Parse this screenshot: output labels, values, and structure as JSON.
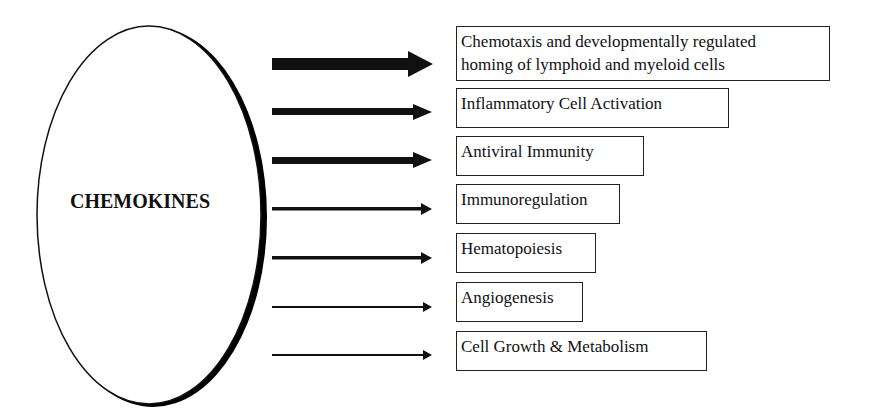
{
  "center": {
    "label": "CHEMOKINES"
  },
  "functions": [
    {
      "label_lines": [
        "Chemotaxis and developmentally regulated",
        "homing of lymphoid and myeloid cells"
      ],
      "arrow_weight": "heavy"
    },
    {
      "label_lines": [
        "Inflammatory Cell Activation"
      ],
      "arrow_weight": "medium-heavy"
    },
    {
      "label_lines": [
        "Antiviral Immunity"
      ],
      "arrow_weight": "medium-heavy"
    },
    {
      "label_lines": [
        "Immunoregulation"
      ],
      "arrow_weight": "medium"
    },
    {
      "label_lines": [
        "Hematopoiesis"
      ],
      "arrow_weight": "medium"
    },
    {
      "label_lines": [
        "Angiogenesis"
      ],
      "arrow_weight": "light"
    },
    {
      "label_lines": [
        "Cell Growth & Metabolism"
      ],
      "arrow_weight": "light"
    }
  ]
}
